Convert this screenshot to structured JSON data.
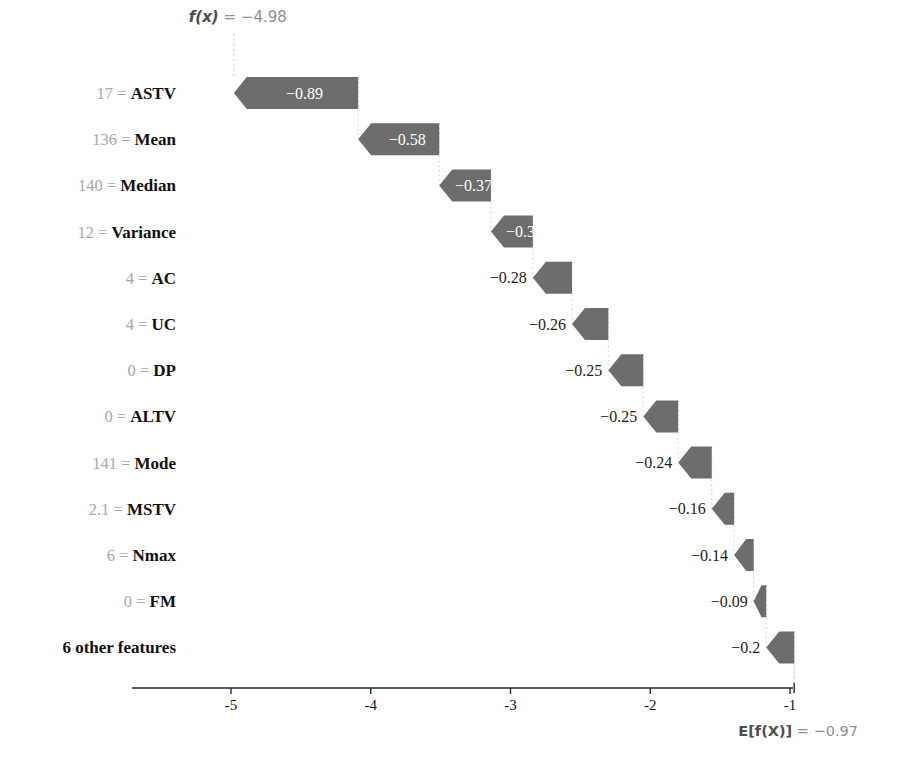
{
  "chart_data": {
    "type": "bar",
    "title": "",
    "subtitle": "",
    "xlabel": "",
    "ylabel": "",
    "orientation": "horizontal",
    "style": "shap-waterfall",
    "grid": false,
    "legend": null,
    "xlim": [
      -5.6,
      -0.78
    ],
    "xticks": [
      -5,
      -4,
      -3,
      -2,
      -1
    ],
    "xtick_labels": [
      "-5",
      "-4",
      "-3",
      "-2",
      "-1"
    ],
    "base_value": -0.97,
    "base_value_label": "E[f(X)] = −0.97",
    "base_value_prefix": "E[f(X)]",
    "base_value_eq": " = −0.97",
    "output_value": -4.98,
    "output_value_label": "f(x) = −4.98",
    "output_value_prefix": "f(x)",
    "output_value_eq": " = −4.98",
    "bar_color": "#6d6d6d",
    "categories": [
      "17 = ASTV",
      "136 = Mean",
      "140 = Median",
      "12 = Variance",
      "4 = AC",
      "4 = UC",
      "0 = DP",
      "0 = ALTV",
      "141 = Mode",
      "2.1 = MSTV",
      "6 = Nmax",
      "0 = FM",
      "6 other features"
    ],
    "values": [
      -0.89,
      -0.58,
      -0.37,
      -0.3,
      -0.28,
      -0.26,
      -0.25,
      -0.25,
      -0.24,
      -0.16,
      -0.14,
      -0.09,
      -0.2
    ],
    "value_labels": [
      "−0.89",
      "−0.58",
      "−0.37",
      "−0.3",
      "−0.28",
      "−0.26",
      "−0.25",
      "−0.25",
      "−0.24",
      "−0.16",
      "−0.14",
      "−0.09",
      "−0.2"
    ],
    "rows": [
      {
        "feature": "ASTV",
        "feature_value": "17",
        "sep": "=",
        "label": "−0.89",
        "value": -0.89,
        "start": -4.09,
        "end": -4.98,
        "label_inside": true
      },
      {
        "feature": "Mean",
        "feature_value": "136",
        "sep": "=",
        "label": "−0.58",
        "value": -0.58,
        "start": -3.51,
        "end": -4.09,
        "label_inside": true
      },
      {
        "feature": "Median",
        "feature_value": "140",
        "sep": "=",
        "label": "−0.37",
        "value": -0.37,
        "start": -3.14,
        "end": -3.51,
        "label_inside": true
      },
      {
        "feature": "Variance",
        "feature_value": "12",
        "sep": "=",
        "label": "−0.3",
        "value": -0.3,
        "start": -2.84,
        "end": -3.14,
        "label_inside": true
      },
      {
        "feature": "AC",
        "feature_value": "4",
        "sep": "=",
        "label": "−0.28",
        "value": -0.28,
        "start": -2.56,
        "end": -2.84,
        "label_inside": false
      },
      {
        "feature": "UC",
        "feature_value": "4",
        "sep": "=",
        "label": "−0.26",
        "value": -0.26,
        "start": -2.3,
        "end": -2.56,
        "label_inside": false
      },
      {
        "feature": "DP",
        "feature_value": "0",
        "sep": "=",
        "label": "−0.25",
        "value": -0.25,
        "start": -2.05,
        "end": -2.3,
        "label_inside": false
      },
      {
        "feature": "ALTV",
        "feature_value": "0",
        "sep": "=",
        "label": "−0.25",
        "value": -0.25,
        "start": -1.8,
        "end": -2.05,
        "label_inside": false
      },
      {
        "feature": "Mode",
        "feature_value": "141",
        "sep": "=",
        "label": "−0.24",
        "value": -0.24,
        "start": -1.56,
        "end": -1.8,
        "label_inside": false
      },
      {
        "feature": "MSTV",
        "feature_value": "2.1",
        "sep": "=",
        "label": "−0.16",
        "value": -0.16,
        "start": -1.4,
        "end": -1.56,
        "label_inside": false
      },
      {
        "feature": "Nmax",
        "feature_value": "6",
        "sep": "=",
        "label": "−0.14",
        "value": -0.14,
        "start": -1.26,
        "end": -1.4,
        "label_inside": false
      },
      {
        "feature": "FM",
        "feature_value": "0",
        "sep": "=",
        "label": "−0.09",
        "value": -0.09,
        "start": -1.17,
        "end": -1.26,
        "label_inside": false
      },
      {
        "feature": "6 other features",
        "feature_value": "",
        "sep": "",
        "label": "−0.2",
        "value": -0.2,
        "start": -0.97,
        "end": -1.17,
        "label_inside": false
      }
    ]
  }
}
